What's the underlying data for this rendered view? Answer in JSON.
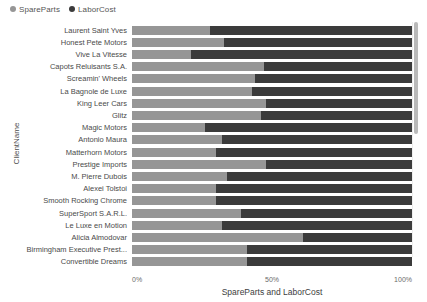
{
  "legend": {
    "position": "top-left",
    "items": [
      {
        "label": "SpareParts",
        "color": "#969696",
        "marker": "circle-marker-icon"
      },
      {
        "label": "LaborCost",
        "color": "#3b3b3b",
        "marker": "circle-marker-icon"
      }
    ]
  },
  "axes": {
    "y_title": "ClientName",
    "x_title": "SpareParts and LaborCost",
    "x_ticks": [
      "0%",
      "50%",
      "100%"
    ]
  },
  "scrollbar": {
    "name": "vertical-scrollbar"
  },
  "chart_data": {
    "type": "bar",
    "title": "",
    "subtitle": "",
    "orientation": "horizontal",
    "stacked": true,
    "normalized": true,
    "xlabel": "SpareParts and LaborCost",
    "ylabel": "ClientName",
    "xlim": [
      0,
      100
    ],
    "xtick_labels": [
      "0%",
      "50%",
      "100%"
    ],
    "grid": false,
    "legend_position": "top-left",
    "units": "percent",
    "categories": [
      "Laurent Saint Yves",
      "Honest Pete Motors",
      "Vive La Vitesse",
      "Capots Reluisants S.A.",
      "Screamin' Wheels",
      "La Bagnole de Luxe",
      "King Leer Cars",
      "Glitz",
      "Magic Motors",
      "Antonio Maura",
      "Matterhorn Motors",
      "Prestige Imports",
      "M. Pierre Dubois",
      "Alexei Tolstoi",
      "Smooth Rocking Chrome",
      "SuperSport S.A.R.L.",
      "Le Luxe en Motion",
      "Alicia Almodovar",
      "Birmingham Executive Prest...",
      "Convertible Dreams"
    ],
    "series": [
      {
        "name": "SpareParts",
        "color": "#969696",
        "values": [
          28,
          33,
          21,
          47,
          44,
          43,
          48,
          46,
          26,
          32,
          30,
          48,
          34,
          30,
          30,
          39,
          32,
          61,
          41,
          41
        ]
      },
      {
        "name": "LaborCost",
        "color": "#3b3b3b",
        "values": [
          72,
          67,
          79,
          53,
          56,
          57,
          52,
          54,
          74,
          68,
          70,
          52,
          66,
          70,
          70,
          61,
          68,
          39,
          59,
          59
        ]
      }
    ]
  }
}
